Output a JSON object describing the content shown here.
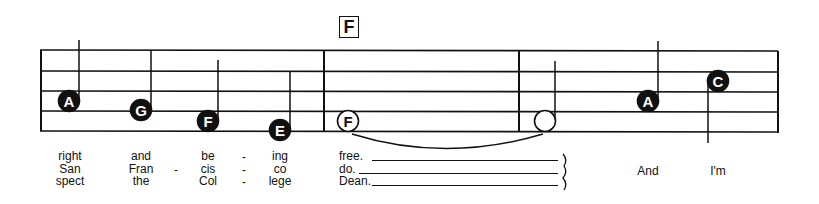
{
  "chord": {
    "label": "F"
  },
  "notes": [
    {
      "letter": "A",
      "x": 69,
      "y": 101,
      "filled": true,
      "stem": "up",
      "stem_top": 40
    },
    {
      "letter": "G",
      "x": 141,
      "y": 110,
      "filled": true,
      "stem": "up",
      "stem_top": 50
    },
    {
      "letter": "F",
      "x": 208,
      "y": 121,
      "filled": true,
      "stem": "up",
      "stem_top": 60
    },
    {
      "letter": "E",
      "x": 280,
      "y": 130,
      "filled": true,
      "stem": "up",
      "stem_top": 71
    },
    {
      "letter": "F",
      "x": 348,
      "y": 121,
      "filled": false,
      "stem": "none"
    },
    {
      "letter": "",
      "x": 545,
      "y": 121,
      "filled": false,
      "stem": "up",
      "stem_top": 61
    },
    {
      "letter": "A",
      "x": 648,
      "y": 101,
      "filled": true,
      "stem": "up",
      "stem_top": 41
    },
    {
      "letter": "C",
      "x": 718,
      "y": 81,
      "filled": true,
      "stem": "down",
      "stem_bottom": 143
    }
  ],
  "lyrics": {
    "columns": [
      {
        "x": 70,
        "lines": [
          "right",
          "San",
          "spect"
        ]
      },
      {
        "x": 141,
        "lines": [
          "and",
          "Fran",
          "the"
        ]
      },
      {
        "x": 208,
        "lines": [
          "be",
          "cis",
          "Col"
        ]
      },
      {
        "x": 280,
        "lines": [
          "ing",
          "co",
          "lege"
        ]
      }
    ],
    "hyphens": [
      {
        "x": 176,
        "row": 1
      },
      {
        "x": 244,
        "row": 0
      },
      {
        "x": 244,
        "row": 1
      },
      {
        "x": 244,
        "row": 2
      }
    ],
    "held": {
      "x": 339,
      "lines": [
        "free.",
        "do.",
        "Dean."
      ]
    },
    "pickup": [
      {
        "x": 648,
        "text": "And"
      },
      {
        "x": 718,
        "text": "I'm"
      }
    ]
  }
}
